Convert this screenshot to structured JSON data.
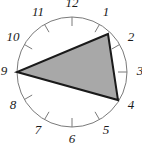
{
  "figure": {
    "type": "geometry-diagram"
  },
  "chart_data": {
    "type": "scatter",
    "title": "",
    "xlabel": "",
    "ylabel": "",
    "subtitle": "",
    "circle": {
      "center_x": 72,
      "center_y": 72,
      "radius": 55,
      "stroke": "#7a7a7a",
      "stroke_width": 1,
      "fill": "none"
    },
    "tick_marks": {
      "count": 12,
      "inner_offset": 9,
      "stroke": "#7a7a7a",
      "stroke_width": 1
    },
    "hour_positions": [
      {
        "label": "1",
        "angle_deg": -60,
        "label_radius": 68
      },
      {
        "label": "2",
        "angle_deg": -30,
        "label_radius": 68
      },
      {
        "label": "3",
        "angle_deg": 0,
        "label_radius": 68
      },
      {
        "label": "4",
        "angle_deg": 30,
        "label_radius": 68
      },
      {
        "label": "5",
        "angle_deg": 60,
        "label_radius": 68
      },
      {
        "label": "6",
        "angle_deg": 90,
        "label_radius": 68
      },
      {
        "label": "7",
        "angle_deg": 120,
        "label_radius": 68
      },
      {
        "label": "8",
        "angle_deg": 150,
        "label_radius": 68
      },
      {
        "label": "9",
        "angle_deg": 180,
        "label_radius": 68
      },
      {
        "label": "10",
        "angle_deg": 210,
        "label_radius": 68
      },
      {
        "label": "11",
        "angle_deg": 240,
        "label_radius": 68
      },
      {
        "label": "12",
        "angle_deg": 270,
        "label_radius": 68
      }
    ],
    "triangle": {
      "vertices": [
        "1",
        "4",
        "9"
      ],
      "points": "108,34 118,100 17,72",
      "fill": "#a8a8a8",
      "stroke": "#1a1a1a",
      "stroke_width": 2
    },
    "colors": {
      "triangle_fill": "#a8a8a8",
      "triangle_stroke": "#1a1a1a",
      "circle_stroke": "#7a7a7a",
      "label_color": "#1a1a1a",
      "background": "#ffffff"
    }
  }
}
